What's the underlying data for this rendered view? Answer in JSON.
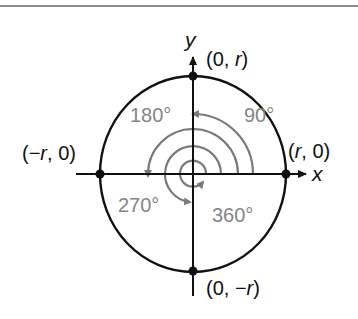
{
  "figure": {
    "kind": "unit circle angle diagram",
    "axes": {
      "x_label": "x",
      "y_label": "y"
    },
    "points": {
      "top": {
        "open": "(0, ",
        "var": "r",
        "close": ")"
      },
      "bottom": {
        "open": "(0, −",
        "var": "r",
        "close": ")"
      },
      "left": {
        "open": "(−",
        "var": "r",
        "close": ", 0)"
      },
      "right": {
        "open": "(",
        "var": "r",
        "close": ", 0)"
      }
    },
    "angles": [
      {
        "label": "90°",
        "value": 90
      },
      {
        "label": "180°",
        "value": 180
      },
      {
        "label": "270°",
        "value": 270
      },
      {
        "label": "360°",
        "value": 360
      }
    ],
    "colors": {
      "ink": "#111111",
      "angle_arcs": "#7a7a7a",
      "angle_labels": "#858585",
      "rule": "#666666"
    }
  }
}
